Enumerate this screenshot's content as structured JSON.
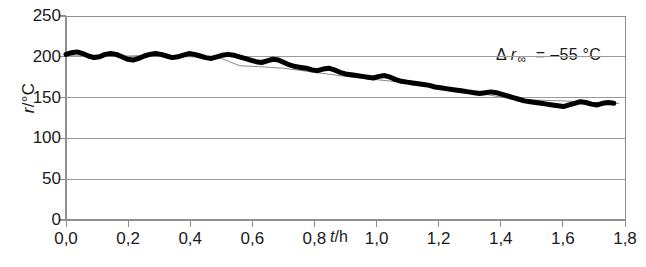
{
  "chart_data": {
    "type": "line",
    "title": "",
    "xlabel": "t/h",
    "ylabel": "r/°C",
    "xlim": [
      0.0,
      1.8
    ],
    "ylim": [
      0,
      250
    ],
    "grid": true,
    "legend_position": "none",
    "x_tick_labels": [
      "0,0",
      "0,2",
      "0,4",
      "0,6",
      "0,8",
      "1,0",
      "1,2",
      "1,4",
      "1,6",
      "1,8"
    ],
    "x_tick_values": [
      0.0,
      0.2,
      0.4,
      0.6,
      0.8,
      1.0,
      1.2,
      1.4,
      1.6,
      1.8
    ],
    "y_tick_labels": [
      "250",
      "200",
      "150",
      "100",
      "50",
      "0"
    ],
    "y_tick_values": [
      250,
      200,
      150,
      100,
      50,
      0
    ],
    "annotations": [
      {
        "name": "delta-r-infinity",
        "symbol": "Δ",
        "variable": "r",
        "subscript": "∞",
        "equals": "=",
        "value": "–55 °C",
        "full_text": "Δ r∞ = –55 °C",
        "x": 1.45,
        "y": 200
      }
    ],
    "series": [
      {
        "name": "measured-temperature",
        "style": "thick-black-oscillating",
        "color": "#000000",
        "linewidth": 5,
        "x": [
          0.0,
          0.018,
          0.036,
          0.054,
          0.072,
          0.09,
          0.108,
          0.126,
          0.144,
          0.162,
          0.18,
          0.198,
          0.216,
          0.234,
          0.252,
          0.27,
          0.288,
          0.306,
          0.324,
          0.342,
          0.36,
          0.378,
          0.396,
          0.414,
          0.432,
          0.45,
          0.468,
          0.486,
          0.504,
          0.522,
          0.54,
          0.558,
          0.576,
          0.594,
          0.612,
          0.63,
          0.648,
          0.666,
          0.684,
          0.702,
          0.72,
          0.738,
          0.756,
          0.774,
          0.792,
          0.81,
          0.828,
          0.846,
          0.864,
          0.882,
          0.9,
          0.918,
          0.936,
          0.954,
          0.972,
          0.99,
          1.008,
          1.026,
          1.044,
          1.062,
          1.08,
          1.098,
          1.116,
          1.134,
          1.152,
          1.17,
          1.188,
          1.206,
          1.224,
          1.242,
          1.26,
          1.278,
          1.296,
          1.314,
          1.332,
          1.35,
          1.368,
          1.386,
          1.404,
          1.422,
          1.44,
          1.458,
          1.476,
          1.494,
          1.512,
          1.53,
          1.548,
          1.566,
          1.584,
          1.602,
          1.62,
          1.638,
          1.656,
          1.674,
          1.692,
          1.71,
          1.728,
          1.746,
          1.764
        ],
        "y": [
          203,
          205,
          206,
          204,
          201,
          199,
          200,
          203,
          204,
          203,
          200,
          197,
          196,
          198,
          201,
          203,
          204,
          203,
          201,
          199,
          200,
          202,
          204,
          203,
          201,
          199,
          198,
          200,
          202,
          203,
          202,
          200,
          198,
          196,
          194,
          193,
          195,
          197,
          196,
          193,
          190,
          188,
          187,
          186,
          184,
          183,
          185,
          186,
          184,
          181,
          179,
          178,
          177,
          176,
          175,
          174,
          176,
          177,
          175,
          172,
          170,
          169,
          168,
          167,
          166,
          165,
          163,
          162,
          161,
          160,
          159,
          158,
          157,
          156,
          155,
          156,
          157,
          156,
          154,
          152,
          150,
          148,
          146,
          145,
          144,
          143,
          142,
          141,
          140,
          139,
          141,
          143,
          145,
          144,
          142,
          141,
          143,
          144,
          143
        ]
      },
      {
        "name": "smoothed-trend-line",
        "style": "thin-gray-line",
        "color": "#8a8a8a",
        "linewidth": 1,
        "x": [
          0.0,
          0.1,
          0.2,
          0.3,
          0.4,
          0.5,
          0.56,
          0.62,
          0.7,
          0.8,
          0.9,
          1.0,
          1.1,
          1.2,
          1.3,
          1.38,
          1.44,
          1.5,
          1.6,
          1.7,
          1.78
        ],
        "y": [
          202,
          202,
          201,
          202,
          200,
          198,
          189,
          188,
          186,
          181,
          176,
          172,
          168,
          164,
          158,
          152,
          148,
          147,
          146,
          144,
          143
        ]
      }
    ]
  },
  "axis": {
    "frame_color": "#8f8f8f",
    "grid_color": "#9a9a9a",
    "tick_color": "#8f8f8f"
  }
}
